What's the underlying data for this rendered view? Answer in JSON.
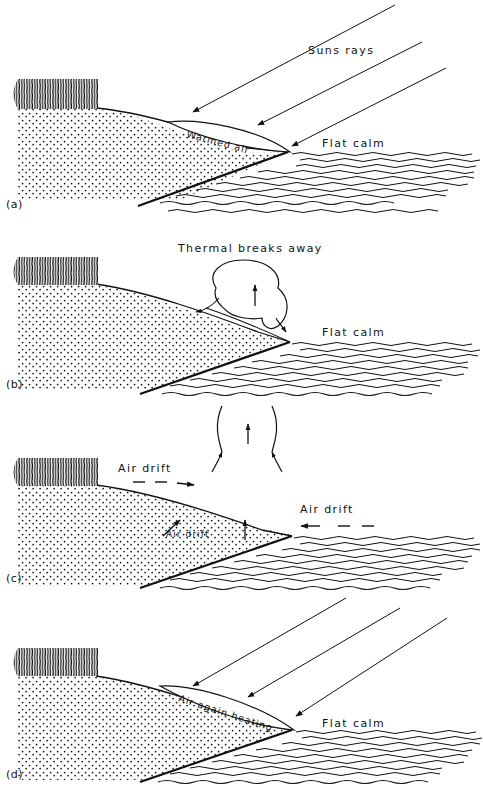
{
  "figure": {
    "ink_color": "#111111",
    "background_color": "#ffffff",
    "panel_count": 4
  },
  "panels": [
    {
      "id": "a",
      "label": "(a)",
      "labels": {
        "sun_rays": "Suns rays",
        "lens": "Warmed air",
        "water": "Flat calm"
      }
    },
    {
      "id": "b",
      "label": "(b)",
      "labels": {
        "thermal": "Thermal breaks away",
        "water": "Flat calm"
      }
    },
    {
      "id": "c",
      "label": "(c)",
      "labels": {
        "drift_top": "Air drift",
        "drift_slope": "Air drift",
        "drift_sea": "Air drift"
      }
    },
    {
      "id": "d",
      "label": "(d)",
      "labels": {
        "lens": "Air again heating",
        "water": "Flat calm"
      }
    }
  ]
}
